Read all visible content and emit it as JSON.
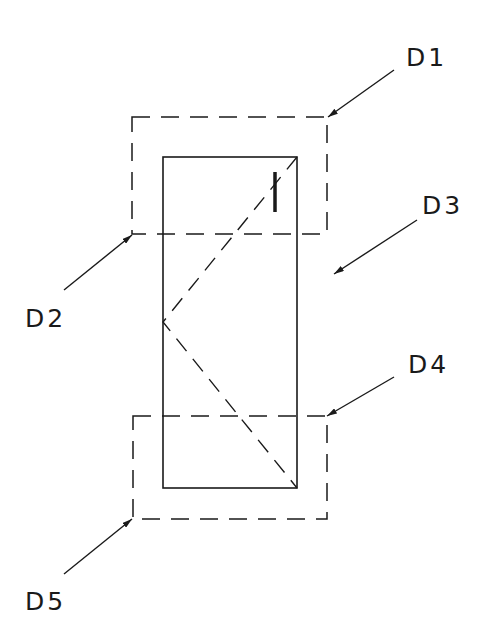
{
  "diagram": {
    "labels": {
      "d1": "D1",
      "d2": "D2",
      "d3": "D3",
      "d4": "D4",
      "d5": "D5"
    },
    "marker": "I",
    "colors": {
      "stroke": "#1a1a1a",
      "background": "#ffffff"
    }
  }
}
